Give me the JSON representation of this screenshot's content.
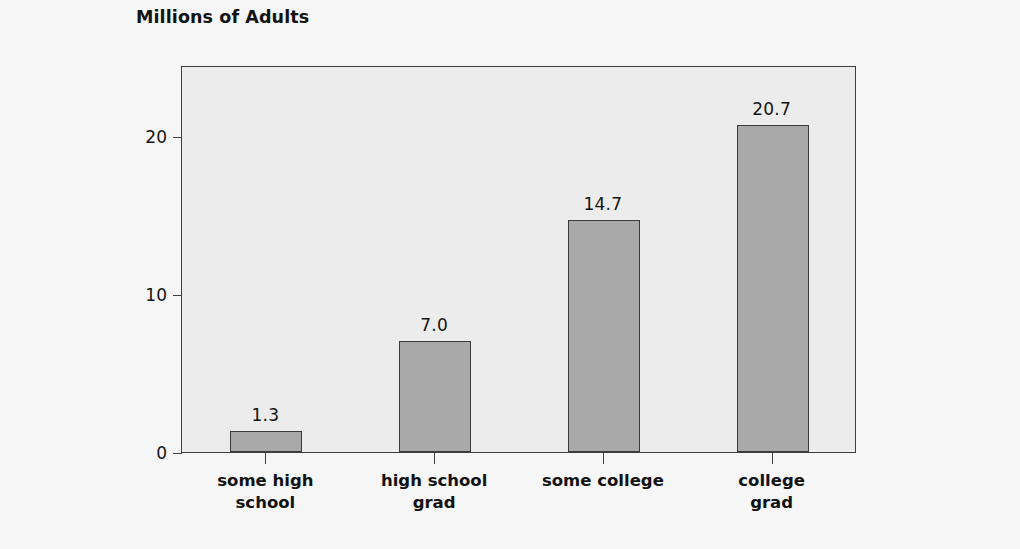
{
  "chart_data": {
    "type": "bar",
    "title": "Millions of Adults",
    "xlabel": "",
    "ylabel": "",
    "categories": [
      "some high\nschool",
      "high school\ngrad",
      "some college",
      "college\ngrad"
    ],
    "values": [
      1.3,
      7.0,
      14.7,
      20.7
    ],
    "value_labels": [
      "1.3",
      "7.0",
      "14.7",
      "20.7"
    ],
    "ylim": [
      0,
      24.5
    ],
    "ytick_values": [
      0,
      10,
      20
    ],
    "ytick_labels": [
      "0",
      "10",
      "20"
    ],
    "grid": false,
    "legend": null,
    "colors": {
      "bar_fill": "#a9a9a9",
      "bar_outline": "#3a3a3a",
      "plot_background": "#ececec",
      "page_background": "#f6f6f6",
      "axis": "#3e3e3e",
      "text": "#141414"
    }
  }
}
